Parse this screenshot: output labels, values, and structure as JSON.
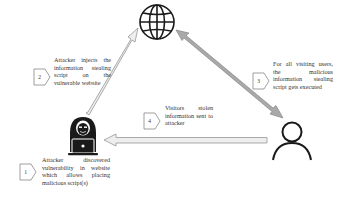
{
  "diagram": {
    "nodes": {
      "website": {
        "icon": "globe-icon",
        "label": "Vulnerable website"
      },
      "attacker": {
        "icon": "hooded-hacker-icon",
        "label": "Attacker"
      },
      "user": {
        "icon": "user-icon",
        "label": "Visiting user"
      }
    },
    "steps": [
      {
        "number": "1",
        "text": "Attacker discovered vulnerability in website which allows placing malicious script(s)"
      },
      {
        "number": "2",
        "text": "Attacker injects the information stealing script on the vulnerable website"
      },
      {
        "number": "3",
        "text": "For all visiting users, the malicious information stealing script gets executed"
      },
      {
        "number": "4",
        "text": "Visitors stolen information sent to attacker"
      }
    ],
    "edges": [
      {
        "from": "attacker",
        "to": "website",
        "style": "light-arrow"
      },
      {
        "from": "website",
        "to": "user",
        "style": "gray-double-arrow"
      },
      {
        "from": "user",
        "to": "attacker",
        "style": "light-arrow"
      }
    ],
    "colors": {
      "icon": "#1a1a1a",
      "arrow_light_fill": "#eeeeee",
      "arrow_gray_fill": "#a9a9a9",
      "arrow_stroke": "#8a8a8a",
      "badge_stroke": "#777777"
    }
  }
}
